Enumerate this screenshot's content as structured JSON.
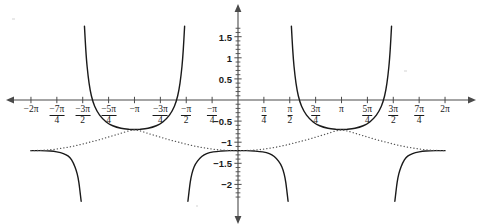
{
  "chart_data": {
    "type": "line",
    "title": "",
    "xlabel": "",
    "ylabel": "",
    "xlim": [
      -6.2832,
      6.2832
    ],
    "ylim": [
      -2.35,
      1.75
    ],
    "grid": false,
    "legend": null,
    "axis_style": {
      "x_axis_arrows": "both",
      "y_axis_arrows": "both",
      "minor_tick_step_y": 0.1,
      "axis_color": "#4a4a4a"
    },
    "x_ticks": [
      {
        "value": -6.2832,
        "label": "−2π",
        "type": "whole"
      },
      {
        "value": -5.4978,
        "label": "−7π",
        "sub": "4",
        "type": "fraction"
      },
      {
        "value": -4.7124,
        "label": "−3π",
        "sub": "2",
        "type": "fraction"
      },
      {
        "value": -3.927,
        "label": "−5π",
        "sub": "4",
        "type": "fraction"
      },
      {
        "value": -3.1416,
        "label": "−π",
        "type": "whole"
      },
      {
        "value": -2.3562,
        "label": "−3π",
        "sub": "4",
        "type": "fraction"
      },
      {
        "value": -1.5708,
        "label": "−π",
        "sub": "2",
        "type": "fraction"
      },
      {
        "value": -0.7854,
        "label": "−π",
        "sub": "4",
        "type": "fraction"
      },
      {
        "value": 0.7854,
        "label": "π",
        "sub": "4",
        "type": "fraction"
      },
      {
        "value": 1.5708,
        "label": "π",
        "sub": "2",
        "type": "fraction"
      },
      {
        "value": 2.3562,
        "label": "3π",
        "sub": "4",
        "type": "fraction"
      },
      {
        "value": 3.1416,
        "label": "π",
        "type": "whole"
      },
      {
        "value": 3.927,
        "label": "5π",
        "sub": "4",
        "type": "fraction"
      },
      {
        "value": 4.7124,
        "label": "3π",
        "sub": "2",
        "type": "fraction"
      },
      {
        "value": 5.4978,
        "label": "7π",
        "sub": "4",
        "type": "fraction"
      },
      {
        "value": 6.2832,
        "label": "2π",
        "type": "whole"
      }
    ],
    "y_ticks": [
      {
        "value": 1.5,
        "label": "1.5"
      },
      {
        "value": 1.0,
        "label": "1"
      },
      {
        "value": 0.5,
        "label": "0.5"
      },
      {
        "value": -0.5,
        "label": "−0.5"
      },
      {
        "value": -1.0,
        "label": "−1"
      },
      {
        "value": -1.5,
        "label": "−1.5"
      },
      {
        "value": -2.0,
        "label": "−2"
      }
    ],
    "series": [
      {
        "name": "solid-curve",
        "style": "solid",
        "color": "#1a1a1a",
        "width": 1.4,
        "asymptotes": [
          -4.7124,
          -1.5708,
          1.5708,
          4.7124
        ],
        "description": "Piecewise curve with vertical asymptotes at odd multiples of pi/2; branches around -pi and pi dip to a minimum of about -0.7; branch around 0 peaks at about -1.2; outer branches flatten to about -1.2 near plus/minus 2pi.",
        "branches": [
          {
            "domain": [
              -6.2832,
              -4.7124
            ],
            "points": [
              [
                -6.2832,
                -1.2
              ],
              [
                -6.0,
                -1.2
              ],
              [
                -5.7,
                -1.21
              ],
              [
                -5.5,
                -1.23
              ],
              [
                -5.3,
                -1.27
              ],
              [
                -5.15,
                -1.33
              ],
              [
                -5.05,
                -1.42
              ],
              [
                -4.95,
                -1.58
              ],
              [
                -4.88,
                -1.75
              ],
              [
                -4.83,
                -1.95
              ],
              [
                -4.79,
                -2.2
              ],
              [
                -4.76,
                -2.4
              ]
            ]
          },
          {
            "domain": [
              -4.7124,
              -1.5708
            ],
            "points": [
              [
                -4.66,
                1.75
              ],
              [
                -4.62,
                1.2
              ],
              [
                -4.58,
                0.8
              ],
              [
                -4.52,
                0.4
              ],
              [
                -4.45,
                0.1
              ],
              [
                -4.35,
                -0.15
              ],
              [
                -4.2,
                -0.36
              ],
              [
                -4.0,
                -0.52
              ],
              [
                -3.8,
                -0.61
              ],
              [
                -3.55,
                -0.67
              ],
              [
                -3.3,
                -0.695
              ],
              [
                -3.1416,
                -0.7
              ],
              [
                -2.98,
                -0.695
              ],
              [
                -2.73,
                -0.67
              ],
              [
                -2.48,
                -0.61
              ],
              [
                -2.28,
                -0.52
              ],
              [
                -2.08,
                -0.36
              ],
              [
                -1.93,
                -0.15
              ],
              [
                -1.83,
                0.1
              ],
              [
                -1.76,
                0.4
              ],
              [
                -1.7,
                0.8
              ],
              [
                -1.66,
                1.2
              ],
              [
                -1.62,
                1.75
              ]
            ]
          },
          {
            "domain": [
              -1.5708,
              1.5708
            ],
            "points": [
              [
                -1.52,
                -2.4
              ],
              [
                -1.49,
                -2.2
              ],
              [
                -1.45,
                -1.95
              ],
              [
                -1.4,
                -1.75
              ],
              [
                -1.33,
                -1.58
              ],
              [
                -1.23,
                -1.45
              ],
              [
                -1.1,
                -1.34
              ],
              [
                -0.95,
                -1.27
              ],
              [
                -0.75,
                -1.23
              ],
              [
                -0.5,
                -1.21
              ],
              [
                -0.25,
                -1.2
              ],
              [
                0,
                -1.2
              ],
              [
                0.25,
                -1.2
              ],
              [
                0.5,
                -1.21
              ],
              [
                0.75,
                -1.23
              ],
              [
                0.95,
                -1.27
              ],
              [
                1.1,
                -1.34
              ],
              [
                1.23,
                -1.45
              ],
              [
                1.33,
                -1.58
              ],
              [
                1.4,
                -1.75
              ],
              [
                1.45,
                -1.95
              ],
              [
                1.49,
                -2.2
              ],
              [
                1.52,
                -2.4
              ]
            ]
          },
          {
            "domain": [
              1.5708,
              4.7124
            ],
            "points": [
              [
                1.62,
                1.75
              ],
              [
                1.66,
                1.2
              ],
              [
                1.7,
                0.8
              ],
              [
                1.76,
                0.4
              ],
              [
                1.83,
                0.1
              ],
              [
                1.93,
                -0.15
              ],
              [
                2.08,
                -0.36
              ],
              [
                2.28,
                -0.52
              ],
              [
                2.48,
                -0.61
              ],
              [
                2.73,
                -0.67
              ],
              [
                2.98,
                -0.695
              ],
              [
                3.1416,
                -0.7
              ],
              [
                3.3,
                -0.695
              ],
              [
                3.55,
                -0.67
              ],
              [
                3.8,
                -0.61
              ],
              [
                4.0,
                -0.52
              ],
              [
                4.2,
                -0.36
              ],
              [
                4.35,
                -0.15
              ],
              [
                4.45,
                0.1
              ],
              [
                4.52,
                0.4
              ],
              [
                4.58,
                0.8
              ],
              [
                4.62,
                1.2
              ],
              [
                4.66,
                1.75
              ]
            ]
          },
          {
            "domain": [
              4.7124,
              6.2832
            ],
            "points": [
              [
                4.76,
                -2.4
              ],
              [
                4.79,
                -2.2
              ],
              [
                4.83,
                -1.95
              ],
              [
                4.88,
                -1.75
              ],
              [
                4.95,
                -1.58
              ],
              [
                5.05,
                -1.42
              ],
              [
                5.15,
                -1.33
              ],
              [
                5.3,
                -1.27
              ],
              [
                5.5,
                -1.23
              ],
              [
                5.7,
                -1.21
              ],
              [
                6.0,
                -1.2
              ],
              [
                6.2832,
                -1.2
              ]
            ]
          }
        ]
      },
      {
        "name": "dotted-curve",
        "style": "dotted",
        "color": "#555555",
        "width": 1.3,
        "description": "Smooth dotted reference curve oscillating between about -1.2 at even multiples of 2pi and 0 and about -0.7 at odd multiples of pi.",
        "points": [
          [
            -6.2832,
            -1.2
          ],
          [
            -6.0,
            -1.195
          ],
          [
            -5.7,
            -1.18
          ],
          [
            -5.4,
            -1.15
          ],
          [
            -5.1,
            -1.11
          ],
          [
            -4.8,
            -1.06
          ],
          [
            -4.5,
            -1.0
          ],
          [
            -4.2,
            -0.94
          ],
          [
            -3.9,
            -0.87
          ],
          [
            -3.6,
            -0.8
          ],
          [
            -3.3,
            -0.73
          ],
          [
            -3.1416,
            -0.71
          ],
          [
            -2.98,
            -0.73
          ],
          [
            -2.7,
            -0.8
          ],
          [
            -2.4,
            -0.87
          ],
          [
            -2.1,
            -0.94
          ],
          [
            -1.8,
            -1.0
          ],
          [
            -1.5,
            -1.06
          ],
          [
            -1.2,
            -1.11
          ],
          [
            -0.9,
            -1.15
          ],
          [
            -0.6,
            -1.18
          ],
          [
            -0.3,
            -1.195
          ],
          [
            0,
            -1.2
          ],
          [
            0.3,
            -1.195
          ],
          [
            0.6,
            -1.18
          ],
          [
            0.9,
            -1.15
          ],
          [
            1.2,
            -1.11
          ],
          [
            1.5,
            -1.06
          ],
          [
            1.8,
            -1.0
          ],
          [
            2.1,
            -0.94
          ],
          [
            2.4,
            -0.87
          ],
          [
            2.7,
            -0.8
          ],
          [
            2.98,
            -0.73
          ],
          [
            3.1416,
            -0.71
          ],
          [
            3.3,
            -0.73
          ],
          [
            3.6,
            -0.8
          ],
          [
            3.9,
            -0.87
          ],
          [
            4.2,
            -0.94
          ],
          [
            4.5,
            -1.0
          ],
          [
            4.8,
            -1.06
          ],
          [
            5.1,
            -1.11
          ],
          [
            5.4,
            -1.15
          ],
          [
            5.7,
            -1.18
          ],
          [
            6.0,
            -1.195
          ],
          [
            6.2832,
            -1.2
          ]
        ]
      }
    ]
  }
}
